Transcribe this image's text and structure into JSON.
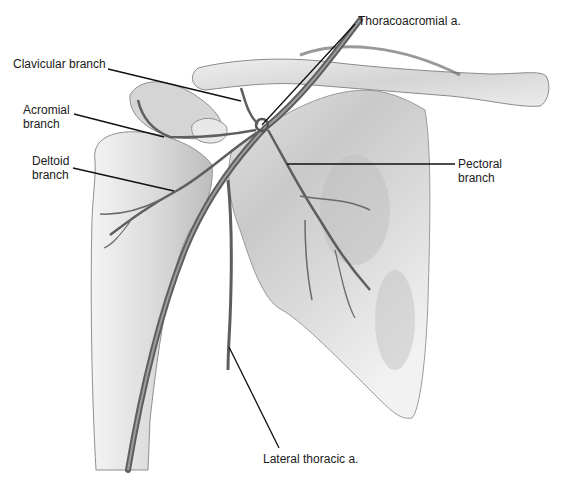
{
  "figure": {
    "background": "#ffffff",
    "bone_fill": "#d9d9d9",
    "bone_stroke": "#8a8a8a",
    "vessel_color": "#5f5f5f",
    "leader_color": "#111111"
  },
  "labels": [
    {
      "id": "thoracoacromial",
      "text": "Thoracoacromial a.",
      "x": 358,
      "y": 14,
      "leader": [
        355,
        24,
        262,
        125
      ]
    },
    {
      "id": "clavicular",
      "text": "Clavicular branch",
      "x": 13,
      "y": 57,
      "leader": [
        108,
        69,
        241,
        101
      ]
    },
    {
      "id": "acromial",
      "text": "Acromial\nbranch",
      "x": 23,
      "y": 103,
      "leader": [
        74,
        114,
        164,
        137
      ]
    },
    {
      "id": "deltoid",
      "text": "Deltoid\nbranch",
      "x": 32,
      "y": 154,
      "leader": [
        73,
        168,
        174,
        191
      ]
    },
    {
      "id": "pectoral",
      "text": "Pectoral\nbranch",
      "x": 458,
      "y": 157,
      "leader": [
        455,
        164,
        287,
        164
      ]
    },
    {
      "id": "lateral_thoracic",
      "text": "Lateral thoracic a.",
      "x": 263,
      "y": 452,
      "leader": [
        279,
        448,
        229,
        347
      ]
    }
  ]
}
